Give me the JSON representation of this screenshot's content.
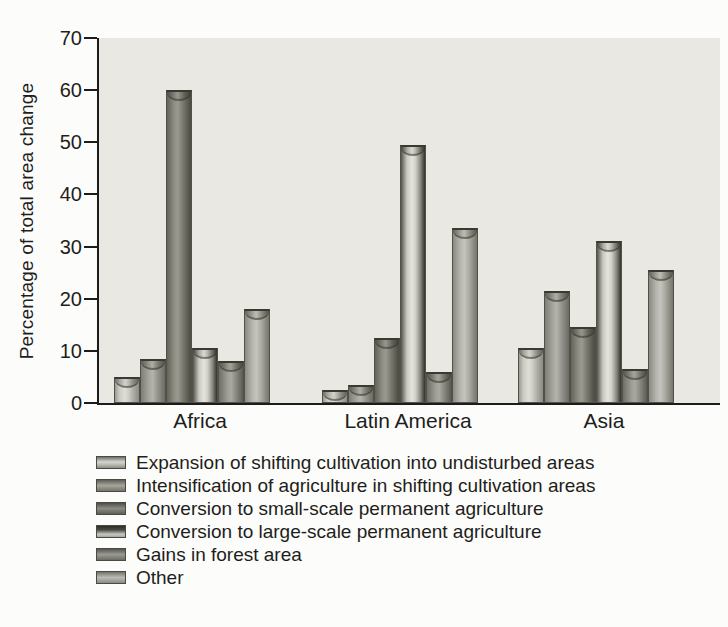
{
  "figure": {
    "background": "#fcfcfa",
    "plot_background": "#e9e8e3",
    "axis_color": "#1c1c1a",
    "text_color": "#1e1e1c"
  },
  "chart_data": {
    "type": "bar",
    "title": "",
    "xlabel": "",
    "ylabel": "Percentage of total area change",
    "ylim": [
      0,
      70
    ],
    "yticks": [
      0,
      10,
      20,
      30,
      40,
      50,
      60,
      70
    ],
    "grid": false,
    "legend_position": "below-left",
    "categories": [
      "Africa",
      "Latin America",
      "Asia"
    ],
    "series": [
      {
        "name": "Expansion of shifting cultivation into undisturbed areas",
        "tone": "#cbcbc3",
        "values": [
          5,
          2.5,
          10.5
        ]
      },
      {
        "name": "Intensification of agriculture in shifting cultivation areas",
        "tone": "#a8a8a0",
        "values": [
          8.5,
          3.5,
          21.5
        ]
      },
      {
        "name": "Conversion to small-scale permanent agriculture",
        "tone": "#8e8e84",
        "values": [
          60,
          12.5,
          14.5
        ]
      },
      {
        "name": "Conversion to large-scale permanent agriculture",
        "tone": "#d2d2ca",
        "values": [
          10.5,
          49.5,
          31
        ]
      },
      {
        "name": "Gains in forest area",
        "tone": "#9d9d95",
        "values": [
          8,
          6,
          6.5
        ]
      },
      {
        "name": "Other",
        "tone": "#b5b5ad",
        "values": [
          18,
          33.5,
          25.5
        ]
      }
    ]
  }
}
